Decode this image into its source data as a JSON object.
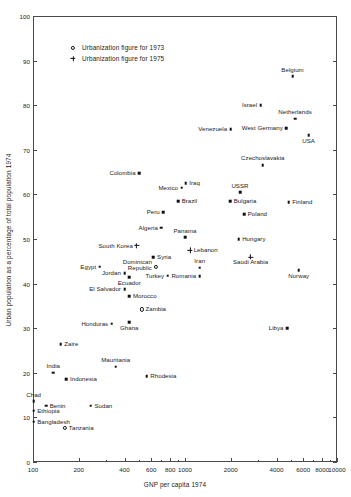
{
  "chart_data": {
    "type": "scatter",
    "title": "",
    "xlabel": "GNP per capita 1974",
    "ylabel": "Urban population as a percentage of total population 1974",
    "xscale": "log",
    "yscale": "linear",
    "xlim": [
      100,
      10000
    ],
    "ylim": [
      0,
      100
    ],
    "grid": false,
    "legend_position": "upper-left-inside",
    "xticks": [
      {
        "value": 100,
        "label": "100"
      },
      {
        "value": 200,
        "label": "200"
      },
      {
        "value": 400,
        "label": "400"
      },
      {
        "value": 600,
        "label": "600"
      },
      {
        "value": 800,
        "label": "800"
      },
      {
        "value": 1000,
        "label": "1000"
      },
      {
        "value": 2000,
        "label": "2000"
      },
      {
        "value": 4000,
        "label": "4000"
      },
      {
        "value": 6000,
        "label": "6000"
      },
      {
        "value": 8000,
        "label": "8000"
      },
      {
        "value": 10000,
        "label": "10000"
      }
    ],
    "xminorticks": [
      300,
      500,
      700,
      900,
      3000,
      5000,
      7000,
      9000
    ],
    "yticks": [
      {
        "value": 0,
        "label": "0"
      },
      {
        "value": 10,
        "label": "10"
      },
      {
        "value": 20,
        "label": "20"
      },
      {
        "value": 30,
        "label": "30"
      },
      {
        "value": 40,
        "label": "40"
      },
      {
        "value": 50,
        "label": "50"
      },
      {
        "value": 60,
        "label": "60"
      },
      {
        "value": 70,
        "label": "70"
      },
      {
        "value": 80,
        "label": "80"
      },
      {
        "value": 90,
        "label": "90"
      },
      {
        "value": 100,
        "label": "100"
      }
    ],
    "legend": [
      {
        "marker": "circle",
        "label": "Urbanization figure for 1973"
      },
      {
        "marker": "plus",
        "label": "Urbanization figure for 1975"
      }
    ],
    "points": [
      {
        "label": "Belgium",
        "x": 5100,
        "y": 86.5,
        "marker": "dot",
        "pos": "above"
      },
      {
        "label": "Israel",
        "x": 3150,
        "y": 80.0,
        "marker": "dot",
        "pos": "left"
      },
      {
        "label": "Netherlands",
        "x": 5300,
        "y": 77.0,
        "marker": "dot",
        "pos": "above"
      },
      {
        "label": "West Germany",
        "x": 4650,
        "y": 74.8,
        "marker": "dot",
        "pos": "left"
      },
      {
        "label": "Venezuela",
        "x": 2000,
        "y": 74.6,
        "marker": "dot",
        "pos": "left"
      },
      {
        "label": "USA",
        "x": 6500,
        "y": 73.3,
        "marker": "dot",
        "pos": "below"
      },
      {
        "label": "Czechoslavakia",
        "x": 3250,
        "y": 66.6,
        "marker": "dot",
        "pos": "above"
      },
      {
        "label": "Colombia",
        "x": 500,
        "y": 64.8,
        "marker": "dot",
        "pos": "left"
      },
      {
        "label": "Iraq",
        "x": 1010,
        "y": 62.5,
        "marker": "dot",
        "pos": "right"
      },
      {
        "label": "Mexico",
        "x": 950,
        "y": 61.5,
        "marker": "dot",
        "pos": "left"
      },
      {
        "label": "USSR",
        "x": 2300,
        "y": 60.5,
        "marker": "dot",
        "pos": "above"
      },
      {
        "label": "Brazil",
        "x": 900,
        "y": 58.5,
        "marker": "dot",
        "pos": "right"
      },
      {
        "label": "Bulgaria",
        "x": 1980,
        "y": 58.5,
        "marker": "dot",
        "pos": "right"
      },
      {
        "label": "Finland",
        "x": 4800,
        "y": 58.2,
        "marker": "dot",
        "pos": "right"
      },
      {
        "label": "Peru",
        "x": 720,
        "y": 56.0,
        "marker": "dot",
        "pos": "left"
      },
      {
        "label": "Poland",
        "x": 2450,
        "y": 55.5,
        "marker": "dot",
        "pos": "right"
      },
      {
        "label": "Algeria",
        "x": 700,
        "y": 52.5,
        "marker": "dot",
        "pos": "left"
      },
      {
        "label": "Panama",
        "x": 1000,
        "y": 50.4,
        "marker": "dot",
        "pos": "above"
      },
      {
        "label": "Hungary",
        "x": 2250,
        "y": 50.0,
        "marker": "dot",
        "pos": "right"
      },
      {
        "label": "South Korea",
        "x": 480,
        "y": 48.5,
        "marker": "plus",
        "pos": "left"
      },
      {
        "label": "Lebanon",
        "x": 1080,
        "y": 47.5,
        "marker": "plus",
        "pos": "right"
      },
      {
        "label": "Saudi Arabia",
        "x": 2700,
        "y": 46.0,
        "marker": "plus",
        "pos": "below"
      },
      {
        "label": "Syria",
        "x": 620,
        "y": 45.9,
        "marker": "dot",
        "pos": "right"
      },
      {
        "label": "Dominican Republic",
        "x": 640,
        "y": 43.8,
        "marker": "circle",
        "pos": "left"
      },
      {
        "label": "Egypt",
        "x": 275,
        "y": 43.8,
        "marker": "dot",
        "pos": "left"
      },
      {
        "label": "Iran",
        "x": 1250,
        "y": 43.6,
        "marker": "dot",
        "pos": "above"
      },
      {
        "label": "Norway",
        "x": 5600,
        "y": 43.0,
        "marker": "dot",
        "pos": "below"
      },
      {
        "label": "Jordan",
        "x": 400,
        "y": 42.3,
        "marker": "dot",
        "pos": "left"
      },
      {
        "label": "Turkey",
        "x": 770,
        "y": 41.8,
        "marker": "dot",
        "pos": "left"
      },
      {
        "label": "Romania",
        "x": 1250,
        "y": 41.7,
        "marker": "dot",
        "pos": "left"
      },
      {
        "label": "Ecuador",
        "x": 430,
        "y": 41.4,
        "marker": "dot",
        "pos": "below"
      },
      {
        "label": "El Salvador",
        "x": 400,
        "y": 38.8,
        "marker": "dot",
        "pos": "left"
      },
      {
        "label": "Morocco",
        "x": 430,
        "y": 37.2,
        "marker": "dot",
        "pos": "right"
      },
      {
        "label": "Zambia",
        "x": 520,
        "y": 34.2,
        "marker": "circle",
        "pos": "right"
      },
      {
        "label": "Honduras",
        "x": 330,
        "y": 31.0,
        "marker": "dot",
        "pos": "left"
      },
      {
        "label": "Ghana",
        "x": 430,
        "y": 31.4,
        "marker": "dot",
        "pos": "below"
      },
      {
        "label": "Libya",
        "x": 4700,
        "y": 30.0,
        "marker": "dot",
        "pos": "left"
      },
      {
        "label": "Zaire",
        "x": 152,
        "y": 26.4,
        "marker": "dot",
        "pos": "right"
      },
      {
        "label": "Mauritania",
        "x": 350,
        "y": 21.4,
        "marker": "dot",
        "pos": "above"
      },
      {
        "label": "India",
        "x": 136,
        "y": 20.0,
        "marker": "dot",
        "pos": "above"
      },
      {
        "label": "Indonesia",
        "x": 166,
        "y": 18.5,
        "marker": "dot",
        "pos": "right"
      },
      {
        "label": "Rhodesia",
        "x": 560,
        "y": 19.3,
        "marker": "dot",
        "pos": "right"
      },
      {
        "label": "Chad",
        "x": 101,
        "y": 13.6,
        "marker": "dot",
        "pos": "above"
      },
      {
        "label": "Benin",
        "x": 122,
        "y": 12.6,
        "marker": "dot",
        "pos": "right"
      },
      {
        "label": "Sudan",
        "x": 240,
        "y": 12.6,
        "marker": "dot",
        "pos": "right"
      },
      {
        "label": "Ethiopia",
        "x": 101,
        "y": 11.5,
        "marker": "dot",
        "pos": "right"
      },
      {
        "label": "Bangladesh",
        "x": 101,
        "y": 9.0,
        "marker": "dot",
        "pos": "right"
      },
      {
        "label": "Tanzania",
        "x": 163,
        "y": 7.6,
        "marker": "circle",
        "pos": "right"
      }
    ]
  }
}
